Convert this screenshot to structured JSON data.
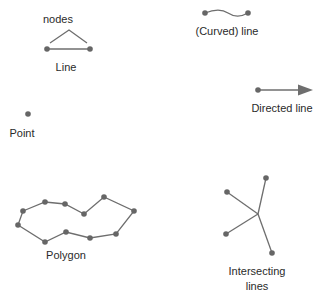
{
  "diagram": {
    "colors": {
      "edge": "#6e6e6e",
      "node": "#666666",
      "text": "#2a2a2a",
      "background": "#ffffff"
    },
    "elements": {
      "line": {
        "label": "Line",
        "annotation": "nodes",
        "nodes": [
          [
            47,
            49
          ],
          [
            90,
            49
          ]
        ]
      },
      "curved_line": {
        "label": "(Curved) line",
        "nodes": [
          [
            205,
            13
          ],
          [
            248,
            13
          ]
        ]
      },
      "directed_line": {
        "label": "Directed line",
        "start": [
          258,
          90
        ],
        "end": [
          313,
          90
        ],
        "arrow": "arrowhead-icon"
      },
      "point": {
        "label": "Point",
        "node": [
          28,
          114
        ]
      },
      "polygon": {
        "label": "Polygon",
        "nodes": [
          [
            23,
            211
          ],
          [
            45,
            202
          ],
          [
            65,
            204
          ],
          [
            84,
            214
          ],
          [
            104,
            197
          ],
          [
            134,
            211
          ],
          [
            116,
            234
          ],
          [
            90,
            238
          ],
          [
            66,
            232
          ],
          [
            45,
            242
          ],
          [
            18,
            225
          ]
        ]
      },
      "intersecting_lines": {
        "label_line1": "Intersecting",
        "label_line2": "lines",
        "center": [
          258,
          214
        ],
        "ends": [
          [
            266,
            178
          ],
          [
            227,
            192
          ],
          [
            226,
            234
          ],
          [
            272,
            253
          ]
        ]
      }
    }
  }
}
